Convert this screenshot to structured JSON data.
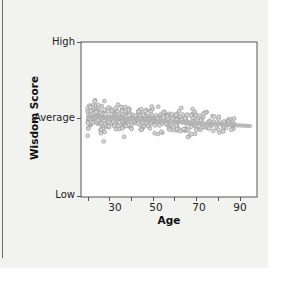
{
  "chart_data": {
    "type": "scatter",
    "title": "",
    "xlabel": "Age",
    "ylabel": "Wisdom Score",
    "x_ticks": [
      30,
      50,
      70,
      90
    ],
    "x_minor_ticks": [
      20,
      40,
      60,
      80
    ],
    "xlim": [
      17,
      98
    ],
    "y_ticks": [
      "Low",
      "Average",
      "High"
    ],
    "ylim_labels": {
      "bottom": "Low",
      "middle": "Average",
      "top": "High"
    },
    "grid": false,
    "legend": null,
    "point_color": "#9a9a9a",
    "trend_line": {
      "color": "#b3b3b3",
      "description": "slightly declining fit line near Average",
      "start": {
        "x": 20,
        "y_rel": 0.02
      },
      "end": {
        "x": 96,
        "y_rel": -0.12
      }
    },
    "n_points_approx": 450
  },
  "axes": {
    "y_high": "High",
    "y_average": "Average",
    "y_low": "Low",
    "x_30": "30",
    "x_50": "50",
    "x_70": "70",
    "x_90": "90",
    "x_title": "Age",
    "y_title": "Wisdom Score"
  }
}
